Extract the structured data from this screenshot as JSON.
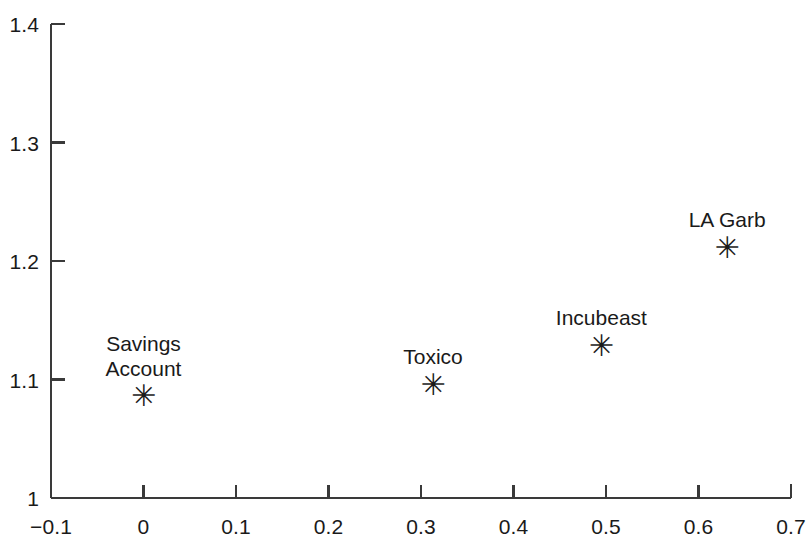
{
  "chart_data": {
    "type": "scatter",
    "title": "",
    "subtitle": "",
    "xlabel": "",
    "ylabel": "",
    "xlim": [
      -0.1,
      0.7
    ],
    "ylim": [
      1,
      1.4
    ],
    "grid": false,
    "legend": false,
    "marker": "asterisk",
    "x_ticks": [
      "−0.1",
      "0",
      "0.1",
      "0.2",
      "0.3",
      "0.4",
      "0.5",
      "0.6",
      "0.7"
    ],
    "x_tick_values": [
      -0.1,
      0,
      0.1,
      0.2,
      0.3,
      0.4,
      0.5,
      0.6,
      0.7
    ],
    "y_ticks": [
      "1",
      "1.1",
      "1.2",
      "1.3",
      "1.4"
    ],
    "y_tick_values": [
      1,
      1.1,
      1.2,
      1.3,
      1.4
    ],
    "points": [
      {
        "label": "Savings\nAccount",
        "name": "Savings Account",
        "x": 0.0,
        "y": 1.086
      },
      {
        "label": "Toxico",
        "name": "Toxico",
        "x": 0.313,
        "y": 1.095
      },
      {
        "label": "Incubeast",
        "name": "Incubeast",
        "x": 0.495,
        "y": 1.128
      },
      {
        "label": "LA Garb",
        "name": "LA Garb",
        "x": 0.631,
        "y": 1.211
      }
    ]
  },
  "style": {
    "axis_color": "#3a3a3a",
    "text_color": "#1a1a1a",
    "marker_color": "#1a1a1a",
    "background": "#ffffff",
    "marker_glyph": "✳"
  }
}
